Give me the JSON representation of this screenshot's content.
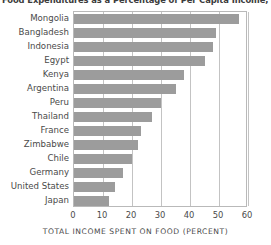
{
  "chart_data": {
    "type": "bar",
    "orientation": "horizontal",
    "title": "Food Expenditures as a Percentage of Per Capita Income, Selected",
    "xlabel": "TOTAL INCOME SPENT ON FOOD (PERCENT)",
    "ylabel": "",
    "xlim": [
      0,
      60
    ],
    "xticks": [
      0,
      10,
      20,
      30,
      40,
      50,
      60
    ],
    "xticklabels": [
      "0",
      "10",
      "20",
      "30",
      "40",
      "50",
      "60"
    ],
    "grid": "vertical",
    "legend": "none",
    "bar_color": "#9c9c9c",
    "categories": [
      "Mongolia",
      "Bangladesh",
      "Indonesia",
      "Egypt",
      "Kenya",
      "Argentina",
      "Peru",
      "Thailand",
      "France",
      "Zimbabwe",
      "Chile",
      "Germany",
      "United States",
      "Japan"
    ],
    "values": [
      57,
      49,
      48,
      45,
      38,
      35,
      30,
      27,
      23,
      22,
      20,
      17,
      14,
      12
    ]
  },
  "axis": {
    "x_label": "TOTAL INCOME SPENT ON FOOD (PERCENT)"
  }
}
